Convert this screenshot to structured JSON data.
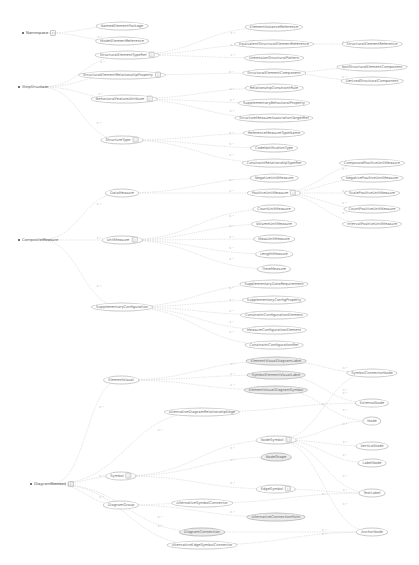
{
  "diagram": {
    "background": "#ffffff",
    "edge_color": "#d4d4d4",
    "node_border_color": "#c9c9c9",
    "shaded_node_fill": "#ececec",
    "text_color": "#6e6e6e",
    "edge_label": "0..*",
    "roots": [
      {
        "id": "r1",
        "label": "Namespace",
        "x": 22,
        "y": 33,
        "badge": "[]"
      },
      {
        "id": "r2",
        "label": "StepStructure",
        "x": 18,
        "y": 87
      },
      {
        "id": "r3",
        "label": "CompositeMeasure",
        "x": 18,
        "y": 240
      },
      {
        "id": "r4",
        "label": "DiagramElement",
        "x": 30,
        "y": 484,
        "badge": "[]"
      }
    ],
    "nodes": [
      {
        "id": "n1",
        "label": "NamedElementPackage",
        "x": 122,
        "y": 26
      },
      {
        "id": "n2",
        "label": "ModelElementReference",
        "x": 122,
        "y": 41
      },
      {
        "id": "n3",
        "label": "StructuralElementTypeRef",
        "x": 127,
        "y": 55,
        "badge": "[]"
      },
      {
        "id": "n4",
        "label": "StructuralElementRelationshipProperty",
        "x": 122,
        "y": 75,
        "badge": "[]"
      },
      {
        "id": "n5",
        "label": "BehavioralFeatureAttribute",
        "x": 124,
        "y": 99,
        "badge": "[]"
      },
      {
        "id": "n6",
        "label": "StructureType",
        "x": 122,
        "y": 140,
        "badge": "[]"
      },
      {
        "id": "n7",
        "label": "DataMeasure",
        "x": 122,
        "y": 193
      },
      {
        "id": "n8",
        "label": "UnitMeasure",
        "x": 122,
        "y": 240,
        "badge": "[]"
      },
      {
        "id": "n9",
        "label": "SupplementaryConfiguration",
        "x": 122,
        "y": 307
      },
      {
        "id": "t1",
        "label": "ElementInstanceReference",
        "x": 274,
        "y": 27
      },
      {
        "id": "t2",
        "label": "EquivalentStructuralElementReference",
        "x": 274,
        "y": 44
      },
      {
        "id": "t3",
        "label": "DimensionStructuralPattern",
        "x": 274,
        "y": 58
      },
      {
        "id": "t4",
        "label": "StructuralElementComponent",
        "x": 274,
        "y": 73
      },
      {
        "id": "t5",
        "label": "RelationshipConstraintRule",
        "x": 274,
        "y": 88
      },
      {
        "id": "t6",
        "label": "SupplementaryBehavioralProperty",
        "x": 274,
        "y": 103
      },
      {
        "id": "t7",
        "label": "StructureMeasureAssociationTargetRef",
        "x": 274,
        "y": 118
      },
      {
        "id": "t8",
        "label": "ReferenceMeasureTypeName",
        "x": 274,
        "y": 133
      },
      {
        "id": "t9",
        "label": "CodeNotificationType",
        "x": 274,
        "y": 148
      },
      {
        "id": "t10",
        "label": "ConstraintRelationshipTypeRef",
        "x": 274,
        "y": 163
      },
      {
        "id": "t11",
        "label": "NegativeUnitMeasure",
        "x": 274,
        "y": 178
      },
      {
        "id": "t12",
        "label": "PositiveUnitMeasure",
        "x": 274,
        "y": 193,
        "badge": "[]"
      },
      {
        "id": "t13",
        "label": "CountUnitMeasure",
        "x": 274,
        "y": 209
      },
      {
        "id": "t14",
        "label": "VolumeUnitMeasure",
        "x": 274,
        "y": 224
      },
      {
        "id": "t15",
        "label": "MassUnitMeasure",
        "x": 274,
        "y": 239
      },
      {
        "id": "t16",
        "label": "LengthMeasure",
        "x": 274,
        "y": 254
      },
      {
        "id": "t17",
        "label": "TimeMeasure",
        "x": 274,
        "y": 269
      },
      {
        "id": "t18",
        "label": "SupplementaryDataRequirement",
        "x": 274,
        "y": 284
      },
      {
        "id": "t19",
        "label": "SupplementaryConfigProperty",
        "x": 274,
        "y": 300
      },
      {
        "id": "t20",
        "label": "ConstraintConfigurationElement",
        "x": 274,
        "y": 315
      },
      {
        "id": "t21",
        "label": "MeasureConfigurationElement",
        "x": 274,
        "y": 330
      },
      {
        "id": "t22",
        "label": "ConstraintConfigurationRef",
        "x": 274,
        "y": 345
      },
      {
        "id": "f1",
        "label": "StructuralElementReference",
        "x": 372,
        "y": 44
      },
      {
        "id": "f2",
        "label": "NonStructuralElementComponent",
        "x": 372,
        "y": 67
      },
      {
        "id": "f3",
        "label": "DerivedStructuralComponent",
        "x": 372,
        "y": 81
      },
      {
        "id": "f4",
        "label": "CompoundPositiveUnitMeasure",
        "x": 372,
        "y": 163
      },
      {
        "id": "f5",
        "label": "NegativePositiveUnitMeasure",
        "x": 372,
        "y": 178
      },
      {
        "id": "f6",
        "label": "ScalePositiveUnitMeasure",
        "x": 372,
        "y": 193
      },
      {
        "id": "f7",
        "label": "CountPositiveUnitMeasure",
        "x": 372,
        "y": 209
      },
      {
        "id": "f8",
        "label": "IntervalPositiveUnitMeasure",
        "x": 372,
        "y": 224
      },
      {
        "id": "d1",
        "label": "ElementVisual",
        "x": 121,
        "y": 380
      },
      {
        "id": "d2",
        "label": "AlternativeDiagramRelationshipEdge",
        "x": 202,
        "y": 412
      },
      {
        "id": "d3",
        "label": "Symbol",
        "x": 121,
        "y": 476,
        "badge": "[]"
      },
      {
        "id": "d4",
        "label": "DiagramGroup",
        "x": 121,
        "y": 505
      },
      {
        "id": "d5",
        "label": "AlternativeSymbolConnector",
        "x": 202,
        "y": 503
      },
      {
        "id": "d6",
        "label": "DiagramConnection",
        "x": 202,
        "y": 532,
        "shaded": true
      },
      {
        "id": "d7",
        "label": "AlternativeEdgeSymbolConnector",
        "x": 202,
        "y": 545
      },
      {
        "id": "s1",
        "label": "ElementVisualDiagramLabel",
        "x": 276,
        "y": 361,
        "shaded": true
      },
      {
        "id": "s2",
        "label": "SymbolElementVisualLabel",
        "x": 276,
        "y": 375,
        "shaded": true
      },
      {
        "id": "s3",
        "label": "ElementVisualDiagramSymbol",
        "x": 276,
        "y": 390,
        "shaded": true
      },
      {
        "id": "s4",
        "label": "NodeSymbol",
        "x": 276,
        "y": 440,
        "badge": "[]"
      },
      {
        "id": "s5",
        "label": "NodeShape",
        "x": 276,
        "y": 457,
        "shaded": true
      },
      {
        "id": "s6",
        "label": "EdgeSymbol",
        "x": 276,
        "y": 489,
        "badge": "[]"
      },
      {
        "id": "s7",
        "label": "AlternativeConnectionPoint",
        "x": 276,
        "y": 517,
        "shaded": true
      },
      {
        "id": "e1",
        "label": "SymbolConnectorNode",
        "x": 372,
        "y": 373
      },
      {
        "id": "e2",
        "label": "ExternalNode",
        "x": 372,
        "y": 403
      },
      {
        "id": "e3",
        "label": "Node",
        "x": 372,
        "y": 421
      },
      {
        "id": "e4",
        "label": "VerticalNode",
        "x": 372,
        "y": 446
      },
      {
        "id": "e5",
        "label": "LabelNode",
        "x": 372,
        "y": 463
      },
      {
        "id": "e6",
        "label": "TextLabel",
        "x": 372,
        "y": 493
      },
      {
        "id": "e7",
        "label": "AnchorNode",
        "x": 372,
        "y": 532
      }
    ],
    "edges": [
      [
        "r1",
        "n1"
      ],
      [
        "r1",
        "n2"
      ],
      [
        "r2",
        "n3"
      ],
      [
        "r2",
        "n4"
      ],
      [
        "r2",
        "n5"
      ],
      [
        "r2",
        "n6"
      ],
      [
        "n3",
        "t1"
      ],
      [
        "n3",
        "t2"
      ],
      [
        "n3",
        "t3"
      ],
      [
        "n4",
        "t4"
      ],
      [
        "n5",
        "t5"
      ],
      [
        "n5",
        "t6"
      ],
      [
        "n5",
        "t7"
      ],
      [
        "n6",
        "t8"
      ],
      [
        "n6",
        "t9"
      ],
      [
        "n6",
        "t10"
      ],
      [
        "t2",
        "f1"
      ],
      [
        "t4",
        "f2"
      ],
      [
        "t4",
        "f3"
      ],
      [
        "r3",
        "n7"
      ],
      [
        "r3",
        "n8"
      ],
      [
        "r3",
        "n9"
      ],
      [
        "n7",
        "t11"
      ],
      [
        "n7",
        "t12"
      ],
      [
        "n8",
        "t13"
      ],
      [
        "n8",
        "t14"
      ],
      [
        "n8",
        "t15"
      ],
      [
        "n8",
        "t16"
      ],
      [
        "n8",
        "t17"
      ],
      [
        "n9",
        "t18"
      ],
      [
        "n9",
        "t19"
      ],
      [
        "n9",
        "t20"
      ],
      [
        "n9",
        "t21"
      ],
      [
        "n9",
        "t22"
      ],
      [
        "t12",
        "f4"
      ],
      [
        "t12",
        "f5"
      ],
      [
        "t12",
        "f6"
      ],
      [
        "t12",
        "f7"
      ],
      [
        "t12",
        "f8"
      ],
      [
        "r4",
        "d1"
      ],
      [
        "r4",
        "d2"
      ],
      [
        "r4",
        "d3"
      ],
      [
        "r4",
        "d4"
      ],
      [
        "r4",
        "d6"
      ],
      [
        "r4",
        "d7"
      ],
      [
        "d1",
        "s1"
      ],
      [
        "d1",
        "s2"
      ],
      [
        "d1",
        "s3"
      ],
      [
        "d2",
        "e2"
      ],
      [
        "d3",
        "s4"
      ],
      [
        "d3",
        "s5"
      ],
      [
        "d3",
        "s6"
      ],
      [
        "d4",
        "d5"
      ],
      [
        "d4",
        "s7"
      ],
      [
        "s1",
        "e1"
      ],
      [
        "s2",
        "e2"
      ],
      [
        "s3",
        "e3"
      ],
      [
        "s4",
        "e1"
      ],
      [
        "s4",
        "e3"
      ],
      [
        "s4",
        "e4"
      ],
      [
        "s4",
        "e5"
      ],
      [
        "s4",
        "e6"
      ],
      [
        "s4",
        "e7"
      ],
      [
        "s6",
        "e6"
      ],
      [
        "d6",
        "e7"
      ],
      [
        "d7",
        "e7"
      ],
      [
        "d5",
        "e6"
      ]
    ]
  }
}
